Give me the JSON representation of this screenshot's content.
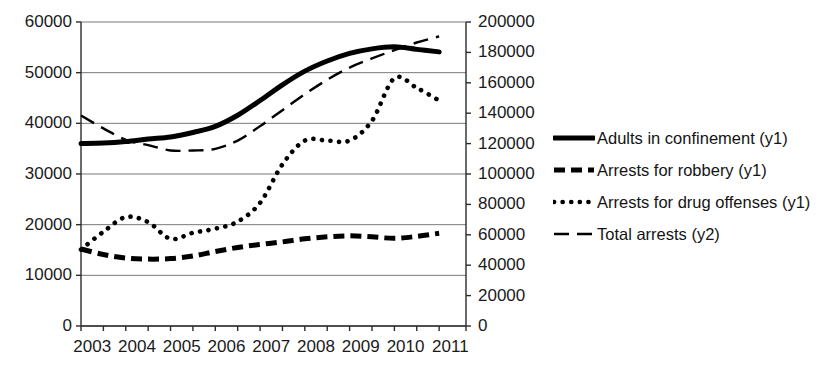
{
  "chart_data": {
    "type": "line",
    "title": "",
    "subtitle": "",
    "xlabel": "",
    "ylabel": "",
    "grid": true,
    "legend_position": "right",
    "x": [
      2003,
      2004,
      2005,
      2006,
      2007,
      2008,
      2009,
      2010,
      2011
    ],
    "categories": [
      "2003",
      "2004",
      "2005",
      "2006",
      "2007",
      "2008",
      "2009",
      "2010",
      "2011"
    ],
    "axes": {
      "x": {
        "tick_labels": [
          "2003",
          "2004",
          "2005",
          "2006",
          "2007",
          "2008",
          "2009",
          "2010",
          "2011"
        ],
        "min": 2003,
        "max": 2011.6
      },
      "y1": {
        "label": "",
        "tick_labels": [
          "0",
          "10000",
          "20000",
          "30000",
          "40000",
          "50000",
          "60000"
        ],
        "ticks": [
          0,
          10000,
          20000,
          30000,
          40000,
          50000,
          60000
        ],
        "ylim": [
          0,
          60000
        ]
      },
      "y2": {
        "label": "",
        "tick_labels": [
          "0",
          "20000",
          "40000",
          "60000",
          "80000",
          "100000",
          "120000",
          "140000",
          "160000",
          "180000",
          "200000"
        ],
        "ticks": [
          0,
          20000,
          40000,
          60000,
          80000,
          100000,
          120000,
          140000,
          160000,
          180000,
          200000
        ],
        "ylim": [
          0,
          200000
        ]
      }
    },
    "series": [
      {
        "name": "Adults in confinement (y1)",
        "axis": "y1",
        "style": "solid",
        "marker": "solid-thick",
        "color": "#000000",
        "x": [
          2003,
          2003.5,
          2004,
          2004.5,
          2005,
          2005.5,
          2006,
          2006.5,
          2007,
          2007.5,
          2008,
          2008.5,
          2009,
          2009.5,
          2010,
          2010.5,
          2011
        ],
        "values": [
          36000,
          36100,
          36400,
          36900,
          37300,
          38200,
          39400,
          41600,
          44500,
          47600,
          50300,
          52300,
          53800,
          54700,
          55100,
          54600,
          54100
        ]
      },
      {
        "name": "Arrests for robbery (y1)",
        "axis": "y1",
        "style": "dashed",
        "marker": "dashed-thick",
        "color": "#000000",
        "x": [
          2003,
          2003.5,
          2004,
          2004.5,
          2005,
          2005.5,
          2006,
          2006.5,
          2007,
          2007.5,
          2008,
          2008.5,
          2009,
          2009.5,
          2010,
          2010.5,
          2011
        ],
        "values": [
          15200,
          14100,
          13400,
          13200,
          13300,
          13800,
          14700,
          15500,
          16100,
          16600,
          17200,
          17600,
          17800,
          17600,
          17300,
          17700,
          18300
        ]
      },
      {
        "name": "Arrests for drug offenses (y1)",
        "axis": "y1",
        "style": "dotted",
        "marker": "dotted",
        "color": "#000000",
        "x": [
          2003,
          2003.5,
          2004,
          2004.5,
          2005,
          2005.5,
          2006,
          2006.5,
          2007,
          2007.5,
          2008,
          2008.5,
          2009,
          2009.5,
          2010,
          2010.5,
          2011
        ],
        "values": [
          15100,
          18600,
          21500,
          20500,
          17200,
          18400,
          19200,
          20600,
          24300,
          31900,
          36600,
          36600,
          36600,
          40500,
          48900,
          47000,
          44500
        ]
      },
      {
        "name": "Total arrests (y2)",
        "axis": "y2",
        "style": "longdash",
        "marker": "longdash-thin",
        "color": "#000000",
        "x": [
          2003,
          2003.5,
          2004,
          2004.5,
          2005,
          2005.5,
          2006,
          2006.5,
          2007,
          2007.5,
          2008,
          2008.5,
          2009,
          2009.5,
          2010,
          2010.5,
          2011
        ],
        "values": [
          138500,
          130000,
          122500,
          119000,
          115500,
          115500,
          116500,
          122000,
          131500,
          142000,
          152500,
          162000,
          170000,
          176000,
          181500,
          186500,
          190500
        ]
      }
    ],
    "legend": [
      {
        "label": "Adults in confinement (y1)",
        "marker": "solid-thick"
      },
      {
        "label": "Arrests for robbery (y1)",
        "marker": "dashed-thick"
      },
      {
        "label": "Arrests for drug offenses (y1)",
        "marker": "dotted"
      },
      {
        "label": "Total arrests (y2)",
        "marker": "longdash-thin"
      }
    ]
  },
  "colors": {
    "ink": "#000000",
    "gridline": "#7a7a7a",
    "axis": "#2b2b2b",
    "background": "#ffffff"
  }
}
